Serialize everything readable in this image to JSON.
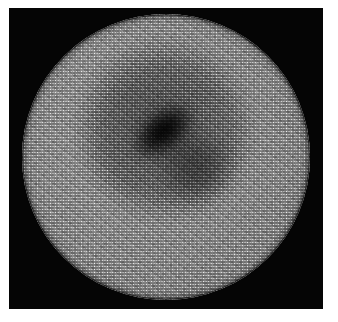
{
  "image": {
    "title": "Lenslet array aperture image",
    "subject": "hexagonally packed lenslet / fibre-bundle aperture with dark central core",
    "canvas": {
      "width": 338,
      "height": 322
    },
    "margin": {
      "color": "#ffffff",
      "top": 8,
      "left": 9,
      "right": 15,
      "bottom": 13
    },
    "background_plate": {
      "color": "#050505",
      "x": 9,
      "y": 8,
      "width": 314,
      "height": 301
    },
    "aperture": {
      "shape": "circle",
      "center_x": 166,
      "center_y": 158,
      "diameter": 288,
      "fill_mean_color": "#8d8d8d",
      "rim_color": "#1a1a1a"
    },
    "texture": {
      "name": "hexagonal-cell-array",
      "pitch_px": 2.6,
      "pattern": "close-packed circular cells, two offset rows",
      "highlight_color": "#e8e8e8",
      "shadow_color": "#4a4a4a"
    },
    "features": [
      {
        "name": "dark-core",
        "label": "Dark elongated nucleus",
        "center_x": 150,
        "center_y": 128,
        "length_px": 72,
        "width_px": 44,
        "orientation_deg": -38,
        "peak_color": "#0a0a0a"
      },
      {
        "name": "diffuse-halo",
        "label": "Diffuse dark halo ring",
        "center_x": 162,
        "center_y": 140,
        "diameter_px": 190,
        "color": "#5d5d5d"
      },
      {
        "name": "secondary-lobe",
        "label": "Secondary dark lobe",
        "center_x": 176,
        "center_y": 172,
        "diameter_px": 78,
        "orientation_deg": -32,
        "color": "#555555"
      },
      {
        "name": "bright-annulus",
        "label": "Bright outer annulus",
        "inner_radius_px": 95,
        "outer_radius_px": 136,
        "color": "#9c9c9c"
      }
    ]
  }
}
